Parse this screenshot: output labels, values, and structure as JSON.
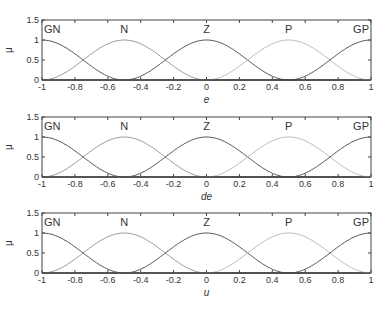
{
  "chart_data": [
    {
      "type": "line",
      "title": "",
      "xlabel": "e",
      "ylabel": "μ",
      "xlim": [
        -1,
        1
      ],
      "ylim": [
        0,
        1.5
      ],
      "xticks": [
        "-1",
        "-0.8",
        "-0.6",
        "-0.4",
        "-0.2",
        "0",
        "0.2",
        "0.4",
        "0.6",
        "0.8",
        "1"
      ],
      "yticks": [
        "0",
        "0.5",
        "1",
        "1.5"
      ],
      "series": [
        {
          "name": "GN",
          "center": -1.0,
          "peak": 1,
          "color": "#555555"
        },
        {
          "name": "N",
          "center": -0.5,
          "peak": 1,
          "color": "#999999"
        },
        {
          "name": "Z",
          "center": 0.0,
          "peak": 1,
          "color": "#555555"
        },
        {
          "name": "P",
          "center": 0.5,
          "peak": 1,
          "color": "#bbbbbb"
        },
        {
          "name": "GP",
          "center": 1.0,
          "peak": 1,
          "color": "#555555"
        }
      ]
    },
    {
      "type": "line",
      "title": "",
      "xlabel": "de",
      "ylabel": "μ",
      "xlim": [
        -1,
        1
      ],
      "ylim": [
        0,
        1.5
      ],
      "xticks": [
        "-1",
        "-0.8",
        "-0.6",
        "-0.4",
        "-0.2",
        "0",
        "0.2",
        "0.4",
        "0.6",
        "0.8",
        "1"
      ],
      "yticks": [
        "0",
        "0.5",
        "1",
        "1.5"
      ],
      "series": [
        {
          "name": "GN",
          "center": -1.0,
          "peak": 1,
          "color": "#555555"
        },
        {
          "name": "N",
          "center": -0.5,
          "peak": 1,
          "color": "#999999"
        },
        {
          "name": "Z",
          "center": 0.0,
          "peak": 1,
          "color": "#555555"
        },
        {
          "name": "P",
          "center": 0.5,
          "peak": 1,
          "color": "#bbbbbb"
        },
        {
          "name": "GP",
          "center": 1.0,
          "peak": 1,
          "color": "#555555"
        }
      ]
    },
    {
      "type": "line",
      "title": "",
      "xlabel": "u",
      "ylabel": "μ",
      "xlim": [
        -1,
        1
      ],
      "ylim": [
        0,
        1.5
      ],
      "xticks": [
        "-1",
        "-0.8",
        "-0.6",
        "-0.4",
        "-0.2",
        "0",
        "0.2",
        "0.4",
        "0.6",
        "0.8",
        "1"
      ],
      "yticks": [
        "0",
        "0.5",
        "1",
        "1.5"
      ],
      "series": [
        {
          "name": "GN",
          "center": -1.0,
          "peak": 1,
          "color": "#555555"
        },
        {
          "name": "N",
          "center": -0.5,
          "peak": 1,
          "color": "#999999"
        },
        {
          "name": "Z",
          "center": 0.0,
          "peak": 1,
          "color": "#555555"
        },
        {
          "name": "P",
          "center": 0.5,
          "peak": 1,
          "color": "#bbbbbb"
        },
        {
          "name": "GP",
          "center": 1.0,
          "peak": 1,
          "color": "#555555"
        }
      ]
    }
  ]
}
